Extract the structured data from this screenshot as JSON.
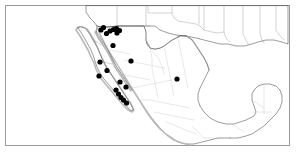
{
  "figure": {
    "region_label": "Mexico and southern United States",
    "frame_color": "#9a9a9a",
    "background_color": "#ffffff",
    "land_outline_color": "#4a4a4a",
    "subdivision_color": "#8d8d8d",
    "dot_color": "#000000",
    "dot_radius": 2.6
  },
  "chart_data": {
    "type": "scatter",
    "xlabel": "",
    "ylabel": "",
    "projection_note": "geographic point-occurrence map",
    "legend": [],
    "series": [
      {
        "name": "occurrence records",
        "marker": "filled-circle",
        "color": "#000000",
        "points": [
          {
            "x": 101.0,
            "y": 30.0,
            "region": "northern Sonora"
          },
          {
            "x": 103.5,
            "y": 27.5,
            "region": "northern Sonora"
          },
          {
            "x": 106.5,
            "y": 33.5,
            "region": "northern Sonora"
          },
          {
            "x": 110.0,
            "y": 31.0,
            "region": "northern Sonora"
          },
          {
            "x": 113.5,
            "y": 29.5,
            "region": "northern Sonora"
          },
          {
            "x": 116.5,
            "y": 28.5,
            "region": "northern Sonora"
          },
          {
            "x": 119.5,
            "y": 30.5,
            "region": "northern Sonora"
          },
          {
            "x": 117.0,
            "y": 33.0,
            "region": "northern Sonora"
          },
          {
            "x": 113.0,
            "y": 45.5,
            "region": "central Sonora"
          },
          {
            "x": 100.0,
            "y": 62.0,
            "region": "northern Baja California"
          },
          {
            "x": 131.0,
            "y": 61.0,
            "region": "Sonora coast"
          },
          {
            "x": 107.0,
            "y": 70.5,
            "region": "central Baja California"
          },
          {
            "x": 99.0,
            "y": 76.0,
            "region": "central Baja California"
          },
          {
            "x": 120.0,
            "y": 82.0,
            "region": "Baja California Sur"
          },
          {
            "x": 126.0,
            "y": 87.0,
            "region": "Baja California Sur"
          },
          {
            "x": 116.0,
            "y": 90.0,
            "region": "Baja California Sur"
          },
          {
            "x": 118.5,
            "y": 94.0,
            "region": "Baja California Sur"
          },
          {
            "x": 121.0,
            "y": 97.5,
            "region": "Baja California Sur"
          },
          {
            "x": 123.5,
            "y": 100.0,
            "region": "Baja California Sur"
          },
          {
            "x": 126.5,
            "y": 103.0,
            "region": "Baja California Sur cape"
          },
          {
            "x": 177.0,
            "y": 79.0,
            "region": "Chihuahua / Durango"
          }
        ]
      }
    ]
  },
  "map": {
    "features": {
      "countries": [
        "United States",
        "Mexico"
      ],
      "water_bodies": [
        "Gulf of California",
        "Gulf of Mexico",
        "Pacific Ocean"
      ],
      "peninsulas": [
        "Baja California",
        "Yucatan"
      ]
    }
  }
}
